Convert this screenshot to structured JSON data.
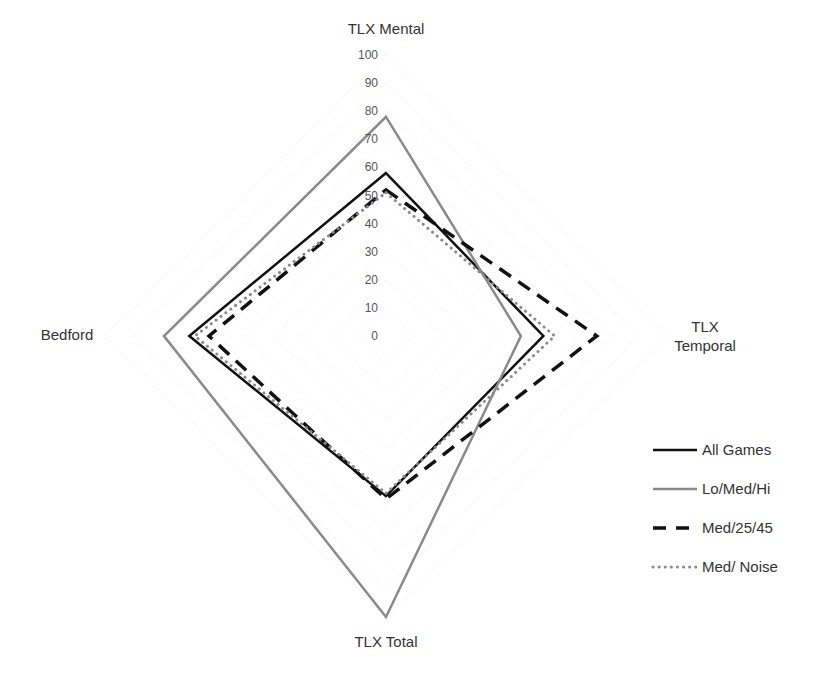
{
  "chart_data": {
    "type": "radar",
    "title": "",
    "axes": [
      "TLX Mental",
      "TLX Temporal",
      "TLX Total",
      "Bedford"
    ],
    "axis_labels": {
      "top": "TLX Mental",
      "right_line1": "TLX",
      "right_line2": "Temporal",
      "bottom": "TLX Total",
      "left": "Bedford"
    },
    "radial_ticks": [
      "0",
      "10",
      "20",
      "30",
      "40",
      "50",
      "60",
      "70",
      "80",
      "90",
      "100"
    ],
    "rlim": [
      0,
      100
    ],
    "grid": true,
    "legend_position": "bottom-right",
    "series": [
      {
        "name": "All Games",
        "values": [
          58,
          56,
          57,
          70
        ],
        "color": "#111111",
        "style": "solid",
        "width": 2.5
      },
      {
        "name": "Lo/Med/Hi",
        "values": [
          78,
          48,
          100,
          79
        ],
        "color": "#8a8a8a",
        "style": "solid",
        "width": 2.5
      },
      {
        "name": "Med/25/45",
        "values": [
          52,
          75,
          58,
          63
        ],
        "color": "#111111",
        "style": "dashed",
        "width": 3.5
      },
      {
        "name": "Med/ Noise",
        "values": [
          51,
          60,
          56,
          68
        ],
        "color": "#8a8a8a",
        "style": "dotted",
        "width": 3
      }
    ]
  }
}
